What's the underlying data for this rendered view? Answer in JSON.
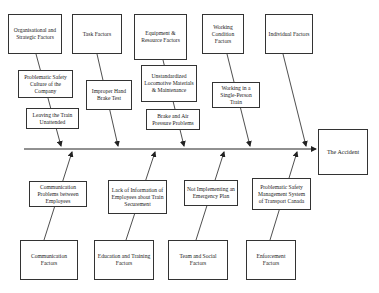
{
  "diagram": {
    "type": "fishbone",
    "effect": "The Accident",
    "top_categories": [
      {
        "label": "Organisational and Strategic Factors",
        "causes": [
          "Problematic Safety Culture of the Company",
          "Leaving the Train Unattended"
        ]
      },
      {
        "label": "Task Factors",
        "causes": [
          "Improper Hand Brake Test"
        ]
      },
      {
        "label": "Equipment & Resource Factors",
        "causes": [
          "Unstandardized Locomotive Materials & Maintenance",
          "Brake and Air Pressure Problems"
        ]
      },
      {
        "label": "Working Condition Factors",
        "causes": [
          "Working in a Single-Person Train"
        ]
      },
      {
        "label": "Individual Factors",
        "causes": []
      }
    ],
    "bottom_categories": [
      {
        "label": "Communication Factors",
        "causes": [
          "Communication Problems between Employees"
        ]
      },
      {
        "label": "Education and Training Factors",
        "causes": [
          "Lack of Information of Employees about Train Securement"
        ]
      },
      {
        "label": "Team and Social Factors",
        "causes": [
          "Not Implementing an Emergency Plan"
        ]
      },
      {
        "label": "Enforcement Factors",
        "causes": [
          "Problematic Safety Management System of Transport Canada"
        ]
      }
    ]
  },
  "colors": {
    "line": "#222222",
    "border": "#333333",
    "background": "#ffffff"
  }
}
